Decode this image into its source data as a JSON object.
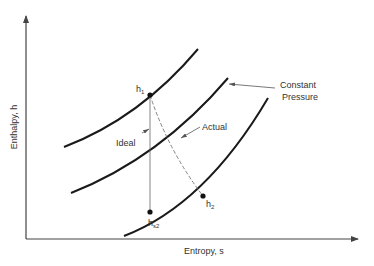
{
  "diagram": {
    "type": "h-s diagram (turbine expansion)",
    "axes": {
      "x_label": "Entropy, s",
      "y_label": "Enthalpy, h"
    },
    "curves": [
      {
        "name": "constant-pressure-line-1",
        "from": [
          64,
          147
        ],
        "ctrl": [
          140,
          120
        ],
        "to": [
          198,
          49
        ]
      },
      {
        "name": "constant-pressure-line-2",
        "from": [
          71,
          193
        ],
        "ctrl": [
          160,
          160
        ],
        "to": [
          228,
          78
        ]
      },
      {
        "name": "constant-pressure-line-3",
        "from": [
          124,
          236
        ],
        "ctrl": [
          200,
          210
        ],
        "to": [
          268,
          98
        ]
      }
    ],
    "points": {
      "h1": {
        "label": "h",
        "sub": "1",
        "x": 150,
        "y": 95
      },
      "hs2": {
        "label": "h",
        "sub": "s2",
        "x": 150,
        "y": 212
      },
      "h2": {
        "label": "h",
        "sub": "2",
        "x": 203,
        "y": 196
      }
    },
    "annotations": {
      "ideal": "Ideal",
      "actual": "Actual",
      "constant_line1": "Constant",
      "constant_line2": "Pressure"
    },
    "colors": {
      "curve": "#1a1a1a",
      "axis": "#444444",
      "thin": "#666666",
      "text": "#333333"
    }
  }
}
